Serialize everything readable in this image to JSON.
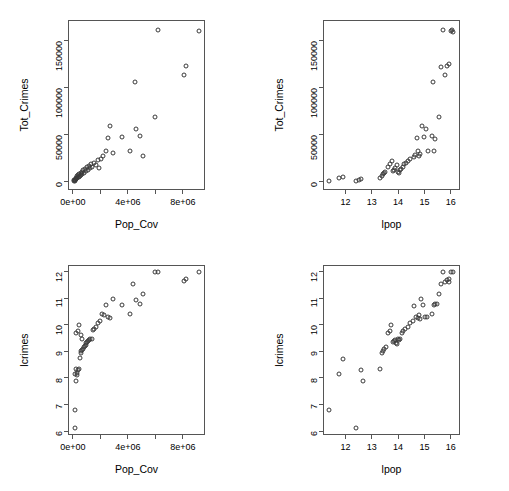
{
  "figure": {
    "width": 509,
    "height": 491,
    "background": "#ffffff",
    "point_color": "#3a3a3a",
    "axis_color": "#555555",
    "layout": "2x2 scatterplot matrix"
  },
  "chart_data": [
    {
      "id": "panel-top-left",
      "type": "scatter",
      "title": "",
      "xlabel": "Pop_Cov",
      "ylabel": "Tot_Crimes",
      "xlim": [
        -350000,
        9600000
      ],
      "ylim": [
        -9000,
        172000
      ],
      "xticks": [
        0,
        4000000,
        8000000
      ],
      "xticklabels": [
        "0e+00",
        "4e+06",
        "8e+06"
      ],
      "xminorticks": [
        2000000,
        6000000
      ],
      "yticks": [
        0,
        50000,
        100000,
        150000
      ],
      "yticklabels": [
        "0",
        "50000",
        "100000",
        "150000"
      ],
      "grid": false,
      "legend": "none",
      "x": [
        87000,
        110000,
        136000,
        148000,
        176000,
        198000,
        232000,
        262000,
        290000,
        330000,
        360000,
        400000,
        430000,
        470000,
        520000,
        560000,
        600000,
        660000,
        700000,
        760000,
        830000,
        880000,
        940000,
        1010000,
        1080000,
        1160000,
        1260000,
        1340000,
        1420000,
        1540000,
        1680000,
        1800000,
        1900000,
        2050000,
        2200000,
        2400000,
        2560000,
        2700000,
        2900000,
        3550000,
        4180000,
        4500000,
        4600000,
        4900000,
        5100000,
        5950000,
        6200000,
        8100000,
        8200000,
        9200000
      ],
      "y": [
        450,
        1200,
        680,
        2100,
        1500,
        3100,
        2400,
        4200,
        3300,
        5500,
        4400,
        6800,
        5300,
        7900,
        6200,
        9100,
        7400,
        10500,
        8300,
        12000,
        9600,
        13500,
        11000,
        15000,
        12500,
        16500,
        14000,
        18500,
        15500,
        20000,
        17500,
        22500,
        14500,
        24000,
        27000,
        33000,
        46500,
        59000,
        30000,
        47000,
        32500,
        106000,
        56000,
        48500,
        27500,
        69000,
        161000,
        113000,
        123000,
        160000
      ]
    },
    {
      "id": "panel-top-right",
      "type": "scatter",
      "title": "",
      "xlabel": "lpop",
      "ylabel": "Tot_Crimes",
      "xlim": [
        11.15,
        16.35
      ],
      "ylim": [
        -9000,
        172000
      ],
      "xticks": [
        12,
        13,
        14,
        15,
        16
      ],
      "xticklabels": [
        "12",
        "13",
        "14",
        "15",
        "16"
      ],
      "yticks": [
        0,
        50000,
        100000,
        150000
      ],
      "yticklabels": [
        "0",
        "50000",
        "100000",
        "150000"
      ],
      "grid": false,
      "legend": "none",
      "x": [
        11.37,
        11.75,
        11.92,
        12.39,
        12.52,
        12.61,
        13.32,
        13.38,
        13.42,
        13.48,
        13.52,
        13.62,
        13.71,
        13.78,
        13.82,
        13.86,
        13.9,
        13.95,
        13.99,
        14.02,
        14.06,
        14.12,
        14.18,
        14.24,
        14.3,
        14.36,
        14.45,
        14.6,
        14.64,
        14.7,
        14.74,
        14.8,
        14.84,
        14.9,
        15.0,
        15.06,
        15.12,
        15.3,
        15.33,
        15.36,
        15.42,
        15.55,
        15.62,
        15.72,
        15.78,
        15.85,
        15.92,
        16.0,
        16.04,
        16.08
      ],
      "y": [
        1000,
        3500,
        5000,
        500,
        2000,
        2600,
        4000,
        6000,
        8000,
        9500,
        10500,
        15500,
        19000,
        22000,
        11000,
        12500,
        14000,
        17500,
        10000,
        9000,
        12000,
        13000,
        15000,
        18500,
        20000,
        21500,
        24000,
        26500,
        28000,
        46500,
        33000,
        27500,
        29500,
        59000,
        47000,
        56000,
        32500,
        48500,
        106000,
        32000,
        45000,
        69000,
        122000,
        161000,
        113000,
        123000,
        125000,
        160000,
        161000,
        159000
      ]
    },
    {
      "id": "panel-bottom-left",
      "type": "scatter",
      "title": "",
      "xlabel": "Pop_Cov",
      "ylabel": "lcrimes",
      "xlim": [
        -350000,
        9600000
      ],
      "ylim": [
        5.85,
        12.25
      ],
      "xticks": [
        0,
        4000000,
        8000000
      ],
      "xticklabels": [
        "0e+00",
        "4e+06",
        "8e+06"
      ],
      "xminorticks": [
        2000000,
        6000000
      ],
      "yticks": [
        6,
        7,
        8,
        9,
        10,
        11,
        12
      ],
      "yticklabels": [
        "6",
        "7",
        "8",
        "9",
        "10",
        "11",
        "12"
      ],
      "grid": false,
      "legend": "none",
      "x": [
        130000,
        180000,
        240000,
        300000,
        330000,
        380000,
        430000,
        500000,
        560000,
        620000,
        680000,
        740000,
        800000,
        870000,
        930000,
        990000,
        1050000,
        1120000,
        1200000,
        1280000,
        1360000,
        1450000,
        1560000,
        1680000,
        1800000,
        1950000,
        2100000,
        2250000,
        2400000,
        2580000,
        2700000,
        2900000,
        3550000,
        4180000,
        4400000,
        4600000,
        4850000,
        5100000,
        5950000,
        6200000,
        8100000,
        8200000,
        9200000,
        160000,
        210000,
        260000,
        350000,
        420000,
        570000,
        700000
      ],
      "y": [
        6.1,
        6.8,
        7.9,
        8.1,
        8.2,
        8.3,
        8.35,
        8.75,
        8.95,
        9.0,
        9.05,
        9.1,
        9.15,
        9.2,
        9.25,
        9.3,
        9.35,
        9.4,
        9.42,
        9.45,
        9.48,
        9.8,
        9.85,
        9.9,
        10.05,
        10.15,
        10.4,
        10.35,
        10.75,
        10.3,
        10.25,
        10.98,
        10.75,
        10.4,
        11.55,
        10.95,
        10.8,
        11.15,
        12.0,
        11.98,
        11.65,
        11.72,
        12.0,
        8.15,
        8.35,
        9.7,
        9.75,
        10.0,
        9.6,
        9.45
      ]
    },
    {
      "id": "panel-bottom-right",
      "type": "scatter",
      "title": "",
      "xlabel": "lpop",
      "ylabel": "lcrimes",
      "xlim": [
        11.15,
        16.35
      ],
      "ylim": [
        5.85,
        12.25
      ],
      "xticks": [
        12,
        13,
        14,
        15,
        16
      ],
      "xticklabels": [
        "12",
        "13",
        "14",
        "15",
        "16"
      ],
      "yticks": [
        6,
        7,
        8,
        9,
        10,
        11,
        12
      ],
      "yticklabels": [
        "6",
        "7",
        "8",
        "9",
        "10",
        "11",
        "12"
      ],
      "grid": false,
      "legend": "none",
      "x": [
        11.37,
        11.75,
        11.92,
        12.39,
        12.61,
        12.66,
        13.32,
        13.38,
        13.42,
        13.48,
        13.55,
        13.62,
        13.68,
        13.74,
        13.8,
        13.84,
        13.88,
        13.92,
        13.96,
        14.0,
        14.04,
        14.08,
        14.14,
        14.2,
        14.28,
        14.36,
        14.45,
        14.55,
        14.62,
        14.68,
        14.74,
        14.78,
        14.82,
        14.86,
        14.95,
        15.02,
        15.08,
        15.3,
        15.35,
        15.4,
        15.48,
        15.55,
        15.62,
        15.7,
        15.78,
        15.85,
        15.92,
        15.95,
        16.02,
        16.08
      ],
      "y": [
        6.8,
        8.15,
        8.72,
        6.1,
        8.28,
        7.88,
        8.33,
        8.95,
        9.0,
        9.1,
        9.15,
        9.7,
        9.78,
        10.0,
        9.35,
        9.38,
        9.42,
        9.32,
        9.28,
        9.45,
        9.42,
        9.48,
        9.7,
        9.75,
        9.85,
        9.9,
        10.05,
        10.15,
        10.7,
        10.3,
        10.25,
        10.35,
        10.2,
        10.98,
        10.75,
        10.28,
        10.3,
        10.4,
        10.75,
        10.8,
        10.78,
        11.15,
        11.55,
        12.0,
        11.62,
        11.68,
        11.72,
        11.6,
        12.0,
        11.98
      ]
    }
  ]
}
